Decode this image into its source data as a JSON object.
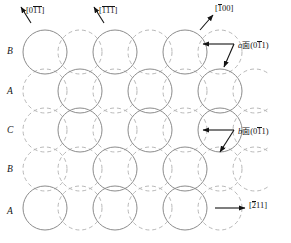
{
  "figure": {
    "name": "fcc-close-packed-stacking-diagram",
    "type": "crystallographic-diagram"
  },
  "colors": {
    "solid_circle_stroke": "#8c8c8c",
    "dashed_circle_stroke": "#b0b0b0",
    "arrow": "#1a1a1a",
    "text": "#141414",
    "background": "#ffffff"
  },
  "layer_labels": [
    {
      "label": "B",
      "y": 52
    },
    {
      "label": "A",
      "y": 92
    },
    {
      "label": "C",
      "y": 131
    },
    {
      "label": "B",
      "y": 170
    },
    {
      "label": "A",
      "y": 212
    }
  ],
  "direction_labels": [
    {
      "name": "direction-0-1bar-1bar",
      "text_parts": [
        {
          "t": "[",
          "bar": false
        },
        {
          "t": "0",
          "bar": false
        },
        {
          "t": "1",
          "bar": true
        },
        {
          "t": "1",
          "bar": true
        },
        {
          "t": "]",
          "bar": false
        }
      ],
      "plain": "[01̅1̅]",
      "x": 26,
      "y": 6
    },
    {
      "name": "direction-1bar-1bar-1bar",
      "text_parts": [
        {
          "t": "[",
          "bar": false
        },
        {
          "t": "1",
          "bar": true
        },
        {
          "t": "1",
          "bar": true
        },
        {
          "t": "1",
          "bar": true
        },
        {
          "t": "]",
          "bar": false
        }
      ],
      "plain": "[1̅1̅1̅]",
      "x": 99,
      "y": 6
    },
    {
      "name": "direction-1bar-0-0",
      "text_parts": [
        {
          "t": "[",
          "bar": false
        },
        {
          "t": "1",
          "bar": true
        },
        {
          "t": "0",
          "bar": false
        },
        {
          "t": "0",
          "bar": false
        },
        {
          "t": "]",
          "bar": false
        }
      ],
      "plain": "[1̅00]",
      "x": 215,
      "y": 4
    },
    {
      "name": "direction-2bar-1-1",
      "text_parts": [
        {
          "t": "[",
          "bar": false
        },
        {
          "t": "2",
          "bar": true
        },
        {
          "t": "1",
          "bar": false
        },
        {
          "t": "1",
          "bar": false
        },
        {
          "t": "]",
          "bar": false
        }
      ],
      "plain": "[2̅11]",
      "x": 249,
      "y": 201
    }
  ],
  "plane_labels": [
    {
      "name": "plane-a",
      "italic_prefix": "a",
      "cjk": "面",
      "paren_open": "(",
      "indices": [
        {
          "t": "0",
          "bar": false
        },
        {
          "t": "1",
          "bar": true
        },
        {
          "t": "1",
          "bar": false
        }
      ],
      "paren_close": ")",
      "plain": "a面(01̅1)",
      "x": 238,
      "y": 41
    },
    {
      "name": "plane-b",
      "italic_prefix": "b",
      "cjk": "面",
      "paren_open": "(",
      "indices": [
        {
          "t": "0",
          "bar": false
        },
        {
          "t": "1",
          "bar": true
        },
        {
          "t": "1",
          "bar": false
        }
      ],
      "paren_close": ")",
      "plain": "b面(01̅1)",
      "x": 238,
      "y": 127
    }
  ],
  "lattice": {
    "radius": 22,
    "row_pitch": 39,
    "col_pitch": 70,
    "solid_rows": [
      {
        "row": "B",
        "cy": 52,
        "cx": [
          45,
          115,
          185
        ]
      },
      {
        "row": "A",
        "cy": 91,
        "cx": [
          80,
          150,
          220
        ]
      },
      {
        "row": "C",
        "cy": 130,
        "cx": [
          80,
          150,
          220
        ]
      },
      {
        "row": "B",
        "cy": 169,
        "cx": [
          115,
          185
        ]
      },
      {
        "row": "A",
        "cy": 208,
        "cx": [
          45,
          115,
          185
        ]
      }
    ],
    "dashed_rows": [
      {
        "cy": 52,
        "cx": [
          80,
          150,
          220
        ]
      },
      {
        "cy": 91,
        "cx": [
          45,
          115,
          185,
          255
        ]
      },
      {
        "cy": 130,
        "cx": [
          45,
          115,
          185,
          255
        ]
      },
      {
        "cy": 169,
        "cx": [
          45,
          80,
          150,
          220,
          255
        ]
      },
      {
        "cy": 208,
        "cx": [
          80,
          150,
          220
        ]
      }
    ]
  }
}
